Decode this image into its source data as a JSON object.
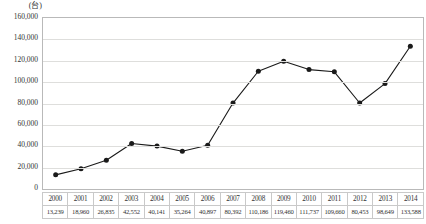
{
  "chart_data": {
    "type": "line",
    "title": "",
    "xlabel": "",
    "ylabel": "",
    "unit_label": "(台)",
    "categories": [
      "2000",
      "2001",
      "2002",
      "2003",
      "2004",
      "2005",
      "2006",
      "2007",
      "2008",
      "2009",
      "2010",
      "2011",
      "2012",
      "2013",
      "2014"
    ],
    "values": [
      13239,
      18960,
      26835,
      42552,
      40141,
      35264,
      40897,
      80392,
      110186,
      119460,
      111737,
      109660,
      80453,
      98649,
      133588
    ],
    "value_labels": [
      "13,239",
      "18,960",
      "26,835",
      "42,552",
      "40,141",
      "35,264",
      "40,897",
      "80,392",
      "110,186",
      "119,460",
      "111,737",
      "109,660",
      "80,453",
      "98,649",
      "133,588"
    ],
    "ylim": [
      0,
      160000
    ],
    "ytick_values": [
      0,
      20000,
      40000,
      60000,
      80000,
      100000,
      120000,
      140000,
      160000
    ],
    "ytick_labels": [
      "0",
      "20,000",
      "40,000",
      "60,000",
      "80,000",
      "100,000",
      "120,000",
      "140,000",
      "160,000"
    ],
    "grid": true,
    "legend": "none",
    "series_color": "#1a1a1a",
    "gridline_color": "#dededc",
    "frame_color": "#b9b9b9",
    "marker": "filled-circle"
  },
  "table": {
    "years": [
      "2000",
      "2001",
      "2002",
      "2003",
      "2004",
      "2005",
      "2006",
      "2007",
      "2008",
      "2009",
      "2010",
      "2011",
      "2012",
      "2013",
      "2014"
    ],
    "values": [
      "13,239",
      "18,960",
      "26,835",
      "42,552",
      "40,141",
      "35,264",
      "40,897",
      "80,392",
      "110,186",
      "119,460",
      "111,737",
      "109,660",
      "80,453",
      "98,649",
      "133,588"
    ]
  }
}
